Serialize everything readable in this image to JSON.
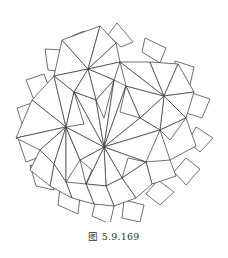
{
  "figure": {
    "caption": "图 5.9.169",
    "stroke_color": "#333333",
    "background": "#ffffff"
  }
}
